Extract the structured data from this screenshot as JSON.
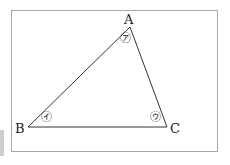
{
  "diagram": {
    "type": "triangle",
    "vertices": [
      {
        "label": "A",
        "x": 130,
        "y": 27
      },
      {
        "label": "B",
        "x": 28,
        "y": 127
      },
      {
        "label": "C",
        "x": 167,
        "y": 127
      }
    ],
    "angle_marks": [
      {
        "at": "A",
        "label": "㋐"
      },
      {
        "at": "B",
        "label": "㋑"
      },
      {
        "at": "C",
        "label": "㋒"
      }
    ],
    "colors": {
      "stroke": "#333333",
      "frame": "#a8a8a8"
    }
  }
}
